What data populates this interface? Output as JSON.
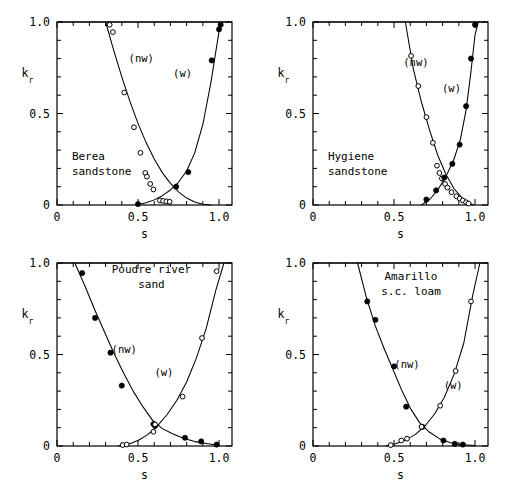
{
  "figure": {
    "name": "relative-permeability-four-panel-figure",
    "axis": {
      "xlabel": "s",
      "ylabel_main": "k",
      "ylabel_sub": "r",
      "xticks": [
        "0",
        "0.5",
        "1.0"
      ],
      "xtick_values": [
        0,
        0.5,
        1.0
      ],
      "yticks": [
        "0",
        "0.5",
        "1.0"
      ],
      "ytick_values": [
        0,
        0.5,
        1.0
      ],
      "xlim": [
        0,
        1.08
      ],
      "ylim": [
        0,
        1.0
      ],
      "minor_ticks_x": 10,
      "minor_ticks_y": 10,
      "grid": false
    },
    "series_labels": {
      "nonwetting": "(nw)",
      "wetting": "(w)"
    }
  },
  "chart_data": [
    {
      "type": "scatter",
      "panel": "top-left",
      "title": "Berea sandstone",
      "title_lines": [
        "Berea",
        "sandstone"
      ],
      "xlabel": "s",
      "ylabel": "k_r",
      "xlim": [
        0,
        1.08
      ],
      "ylim": [
        0,
        1.0
      ],
      "grid": false,
      "series": [
        {
          "name": "(nw)",
          "marker": "open-circle",
          "label_x": 0.52,
          "label_y": 0.78,
          "x": [
            0.325,
            0.345,
            0.415,
            0.475,
            0.515,
            0.545,
            0.555,
            0.575,
            0.595,
            0.635,
            0.655,
            0.675,
            0.695
          ],
          "y": [
            0.985,
            0.945,
            0.615,
            0.425,
            0.285,
            0.175,
            0.155,
            0.115,
            0.085,
            0.025,
            0.022,
            0.02,
            0.018
          ],
          "curve_x": [
            0.3,
            0.35,
            0.4,
            0.45,
            0.5,
            0.55,
            0.6,
            0.65,
            0.7,
            0.75,
            0.8,
            0.85,
            0.9,
            0.95
          ],
          "curve_y": [
            1.0,
            0.845,
            0.7,
            0.566,
            0.446,
            0.341,
            0.251,
            0.177,
            0.118,
            0.072,
            0.038,
            0.016,
            0.004,
            0.0
          ]
        },
        {
          "name": "(w)",
          "marker": "filled-circle",
          "label_x": 0.775,
          "label_y": 0.7,
          "x": [
            0.5,
            0.735,
            0.81,
            0.955,
            1.0,
            1.01
          ],
          "y": [
            0.005,
            0.1,
            0.18,
            0.79,
            0.96,
            0.985
          ],
          "curve_x": [
            0.49,
            0.55,
            0.6,
            0.65,
            0.7,
            0.75,
            0.8,
            0.85,
            0.9,
            0.95,
            1.0,
            1.02
          ],
          "curve_y": [
            0.0,
            0.012,
            0.028,
            0.051,
            0.082,
            0.124,
            0.186,
            0.285,
            0.44,
            0.67,
            0.95,
            1.0
          ]
        }
      ]
    },
    {
      "type": "scatter",
      "panel": "top-right",
      "title": "Hygiene sandstone",
      "title_lines": [
        "Hygiene",
        "sandstone"
      ],
      "xlabel": "s",
      "ylabel": "k_r",
      "xlim": [
        0,
        1.08
      ],
      "ylim": [
        0,
        1.0
      ],
      "grid": false,
      "series": [
        {
          "name": "(nw)",
          "marker": "open-circle",
          "label_x": 0.635,
          "label_y": 0.76,
          "x": [
            0.605,
            0.65,
            0.7,
            0.74,
            0.765,
            0.78,
            0.795,
            0.815,
            0.83,
            0.855,
            0.885,
            0.905,
            0.925,
            0.945,
            0.96
          ],
          "y": [
            0.815,
            0.65,
            0.48,
            0.34,
            0.215,
            0.175,
            0.145,
            0.115,
            0.095,
            0.07,
            0.048,
            0.035,
            0.025,
            0.015,
            0.008
          ],
          "curve_x": [
            0.57,
            0.62,
            0.67,
            0.72,
            0.77,
            0.82,
            0.87,
            0.92,
            0.96,
            0.99
          ],
          "curve_y": [
            1.0,
            0.74,
            0.56,
            0.408,
            0.272,
            0.168,
            0.09,
            0.038,
            0.012,
            0.0
          ]
        },
        {
          "name": "(w)",
          "marker": "filled-circle",
          "label_x": 0.855,
          "label_y": 0.62,
          "x": [
            0.7,
            0.76,
            0.81,
            0.86,
            0.905,
            0.945,
            0.975,
            1.0
          ],
          "y": [
            0.03,
            0.08,
            0.15,
            0.225,
            0.33,
            0.54,
            0.8,
            0.985
          ],
          "curve_x": [
            0.67,
            0.72,
            0.77,
            0.82,
            0.87,
            0.91,
            0.945,
            0.975,
            1.0,
            1.02
          ],
          "curve_y": [
            0.0,
            0.03,
            0.082,
            0.155,
            0.25,
            0.36,
            0.52,
            0.73,
            0.93,
            1.0
          ]
        }
      ]
    },
    {
      "type": "scatter",
      "panel": "bottom-left",
      "title": "Poudre river sand",
      "title_lines": [
        "Poudre river",
        "sand"
      ],
      "xlabel": "s",
      "ylabel": "k_r",
      "xlim": [
        0,
        1.08
      ],
      "ylim": [
        0,
        1.0
      ],
      "grid": false,
      "series": [
        {
          "name": "(nw)",
          "marker": "filled-circle",
          "label_x": 0.415,
          "label_y": 0.51,
          "x": [
            0.155,
            0.235,
            0.33,
            0.4,
            0.595,
            0.605,
            0.79,
            0.89,
            0.985
          ],
          "y": [
            0.945,
            0.7,
            0.51,
            0.33,
            0.12,
            0.11,
            0.045,
            0.025,
            0.008
          ],
          "curve_x": [
            0.11,
            0.17,
            0.23,
            0.29,
            0.35,
            0.41,
            0.47,
            0.53,
            0.59,
            0.65,
            0.71,
            0.78,
            0.85,
            0.92,
            1.0
          ],
          "curve_y": [
            1.0,
            0.88,
            0.75,
            0.63,
            0.51,
            0.4,
            0.3,
            0.215,
            0.14,
            0.095,
            0.068,
            0.042,
            0.024,
            0.014,
            0.004
          ]
        },
        {
          "name": "(w)",
          "marker": "open-circle",
          "label_x": 0.66,
          "label_y": 0.38,
          "x": [
            0.405,
            0.43,
            0.595,
            0.605,
            0.775,
            0.895,
            0.985
          ],
          "y": [
            0.005,
            0.008,
            0.078,
            0.118,
            0.27,
            0.59,
            0.955
          ],
          "curve_x": [
            0.38,
            0.44,
            0.5,
            0.56,
            0.62,
            0.68,
            0.74,
            0.8,
            0.86,
            0.92,
            0.98,
            1.03
          ],
          "curve_y": [
            0.0,
            0.01,
            0.03,
            0.062,
            0.11,
            0.172,
            0.25,
            0.35,
            0.48,
            0.64,
            0.85,
            1.0
          ]
        }
      ]
    },
    {
      "type": "scatter",
      "panel": "bottom-right",
      "title": "Amarillo s.c. loam",
      "title_lines": [
        "Amarillo",
        "s.c. loam"
      ],
      "xlabel": "s",
      "ylabel": "k_r",
      "xlim": [
        0,
        1.08
      ],
      "ylim": [
        0,
        1.0
      ],
      "grid": false,
      "series": [
        {
          "name": "(nw)",
          "marker": "filled-circle",
          "label_x": 0.58,
          "label_y": 0.425,
          "x": [
            0.335,
            0.385,
            0.5,
            0.575,
            0.675,
            0.805,
            0.875,
            0.925
          ],
          "y": [
            0.79,
            0.69,
            0.435,
            0.215,
            0.105,
            0.03,
            0.012,
            0.008
          ],
          "curve_x": [
            0.275,
            0.33,
            0.385,
            0.44,
            0.495,
            0.55,
            0.605,
            0.66,
            0.715,
            0.78,
            0.85,
            0.92,
            1.0
          ],
          "curve_y": [
            1.0,
            0.81,
            0.655,
            0.53,
            0.415,
            0.3,
            0.2,
            0.125,
            0.078,
            0.04,
            0.018,
            0.007,
            0.002
          ]
        },
        {
          "name": "(w)",
          "marker": "open-circle",
          "label_x": 0.865,
          "label_y": 0.31,
          "x": [
            0.48,
            0.545,
            0.58,
            0.67,
            0.785,
            0.88,
            0.975
          ],
          "y": [
            0.005,
            0.03,
            0.04,
            0.105,
            0.22,
            0.41,
            0.79
          ],
          "curve_x": [
            0.45,
            0.51,
            0.57,
            0.63,
            0.69,
            0.75,
            0.81,
            0.87,
            0.93,
            0.985,
            1.03
          ],
          "curve_y": [
            0.0,
            0.012,
            0.032,
            0.062,
            0.108,
            0.175,
            0.265,
            0.39,
            0.56,
            0.82,
            1.0
          ]
        }
      ]
    }
  ]
}
